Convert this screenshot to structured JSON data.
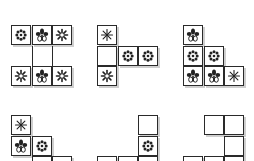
{
  "figure": {
    "cell_size": 20,
    "line_color": "#2a2a2a",
    "shadow_color": "#cfcfcf",
    "symbols": {
      "dot-flower": "eight-dot flower",
      "tulip": "tulip flower",
      "snowflake": "asterisk snowflake",
      "star": "thin asterisk star"
    },
    "panels": [
      {
        "id": 1,
        "x": 11,
        "y": 25,
        "cells": [
          {
            "r": 0,
            "c": 0,
            "sym": "dot-flower"
          },
          {
            "r": 0,
            "c": 1,
            "sym": "tulip"
          },
          {
            "r": 0,
            "c": 2,
            "sym": "snowflake"
          },
          {
            "r": 2,
            "c": 0,
            "sym": "snowflake"
          },
          {
            "r": 2,
            "c": 1,
            "sym": "tulip"
          },
          {
            "r": 2,
            "c": 2,
            "sym": "snowflake"
          }
        ],
        "connectors": [
          {
            "c": 1
          },
          {
            "c": 2
          }
        ]
      },
      {
        "id": 2,
        "x": 97,
        "y": 25,
        "cells": [
          {
            "r": 0,
            "c": 0,
            "sym": "star"
          },
          {
            "r": 1,
            "c": 0,
            "sym": ""
          },
          {
            "r": 1,
            "c": 1,
            "sym": "dot-flower"
          },
          {
            "r": 1,
            "c": 2,
            "sym": "dot-flower"
          },
          {
            "r": 2,
            "c": 0,
            "sym": "snowflake"
          }
        ]
      },
      {
        "id": 3,
        "x": 183,
        "y": 25,
        "cells": [
          {
            "r": 0,
            "c": 0,
            "sym": "tulip"
          },
          {
            "r": 1,
            "c": 0,
            "sym": "dot-flower"
          },
          {
            "r": 1,
            "c": 1,
            "sym": "dot-flower"
          },
          {
            "r": 2,
            "c": 0,
            "sym": "tulip"
          },
          {
            "r": 2,
            "c": 1,
            "sym": "tulip"
          },
          {
            "r": 2,
            "c": 2,
            "sym": "star"
          }
        ]
      },
      {
        "id": 4,
        "x": 11,
        "y": 115,
        "cells": [
          {
            "r": 0,
            "c": 0,
            "sym": "star"
          },
          {
            "r": 1,
            "c": 0,
            "sym": "tulip"
          },
          {
            "r": 1,
            "c": 1,
            "sym": "dot-flower"
          },
          {
            "r": 2,
            "c": 1,
            "sym": ""
          },
          {
            "r": 2,
            "c": 2,
            "sym": ""
          }
        ]
      },
      {
        "id": 5,
        "x": 97,
        "y": 115,
        "cells": [
          {
            "r": 0,
            "c": 2,
            "sym": ""
          },
          {
            "r": 1,
            "c": 2,
            "sym": "dot-flower"
          },
          {
            "r": 2,
            "c": 0,
            "sym": ""
          },
          {
            "r": 2,
            "c": 1,
            "sym": ""
          },
          {
            "r": 2,
            "c": 2,
            "sym": ""
          }
        ]
      },
      {
        "id": 6,
        "x": 183,
        "y": 115,
        "cells": [
          {
            "r": 0,
            "c": 1,
            "sym": ""
          },
          {
            "r": 0,
            "c": 2,
            "sym": ""
          },
          {
            "r": 1,
            "c": 2,
            "sym": ""
          },
          {
            "r": 2,
            "c": 0,
            "sym": ""
          },
          {
            "r": 2,
            "c": 1,
            "sym": ""
          },
          {
            "r": 2,
            "c": 2,
            "sym": ""
          }
        ]
      }
    ]
  }
}
